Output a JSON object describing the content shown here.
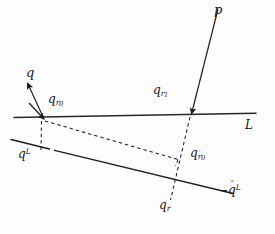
{
  "figure": {
    "background_color": "#fdfdfd",
    "stroke_color": "#1a1a1a",
    "width": 275,
    "height": 234
  },
  "labels": {
    "p": "p",
    "q": "q",
    "q_r0": {
      "base": "q",
      "sub": "r",
      "sub2": "0"
    },
    "q_r1": {
      "base": "q",
      "sub": "r",
      "sub2": "1"
    },
    "L": "L",
    "q_sup_L": {
      "base": "q",
      "sup": "L"
    },
    "q_rhat_0": {
      "base": "q",
      "sub": "r",
      "hat": "ˆ",
      "sub2": "0"
    },
    "q_r": {
      "base": "q",
      "sub": "r"
    },
    "minus_q_hat_L": {
      "minus": "−",
      "base": "q",
      "hat": "ˆ",
      "sup": "L"
    }
  },
  "geometry": {
    "line_L": {
      "x1": 14,
      "y1": 117,
      "x2": 256,
      "y2": 113,
      "style": "solid"
    },
    "line_lower": {
      "x1": 11,
      "y1": 140,
      "x2": 233,
      "y2": 194,
      "style": "solid",
      "note": "broken segment near x=50"
    },
    "arrow_p": {
      "x1": 218,
      "y1": 9,
      "x2": 191,
      "y2": 115,
      "head_at": "end"
    },
    "arrow_q": {
      "x1": 43,
      "y1": 118,
      "x2": 27,
      "y2": 81,
      "head_at": "end"
    },
    "arrow_incident_left": {
      "x1": 30,
      "y1": 104,
      "x2": 45,
      "y2": 120,
      "head_at": "end"
    },
    "dashed_long": {
      "x1": 44,
      "y1": 120,
      "x2": 178,
      "y2": 159,
      "style": "dashed"
    },
    "dashed_vert_left": {
      "x1": 41,
      "y1": 121,
      "x2": 41,
      "y2": 150,
      "style": "dashed"
    },
    "dashed_vert_right": {
      "x1": 190,
      "y1": 117,
      "x2": 171,
      "y2": 200,
      "style": "dashed"
    },
    "dashed_corner": {
      "x1": 178,
      "y1": 159,
      "x2": 176,
      "y2": 165,
      "style": "dashed"
    }
  }
}
